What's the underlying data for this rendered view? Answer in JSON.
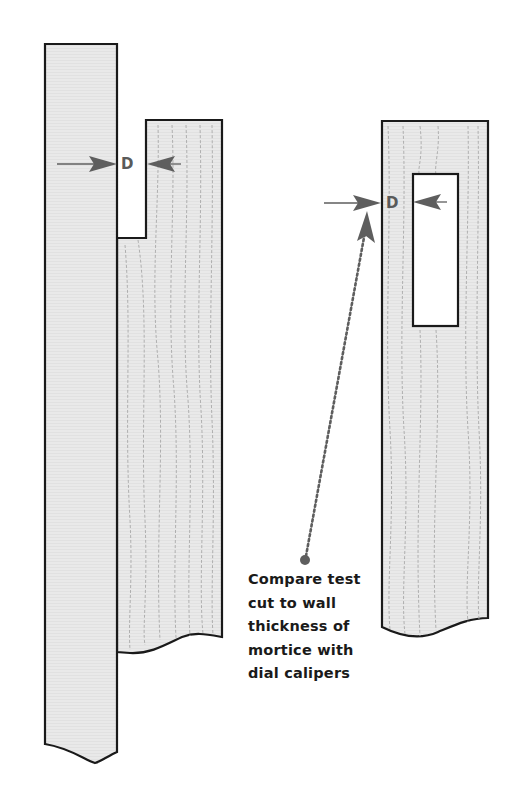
{
  "diagram": {
    "left_figure": {
      "description": "Test cut (tenon cheek) on board",
      "dimension_label": "D"
    },
    "right_figure": {
      "description": "Board with mortice",
      "dimension_label": "D"
    },
    "callout": {
      "lines": [
        "Compare test",
        "cut to wall",
        "thickness of",
        "mortice with",
        "dial calipers"
      ]
    },
    "colors": {
      "wood_fill": "#e8e8e8",
      "outline": "#1a1a1a",
      "grain": "#a8a8a8",
      "arrow": "#5e5e5e",
      "background": "#ffffff"
    }
  }
}
